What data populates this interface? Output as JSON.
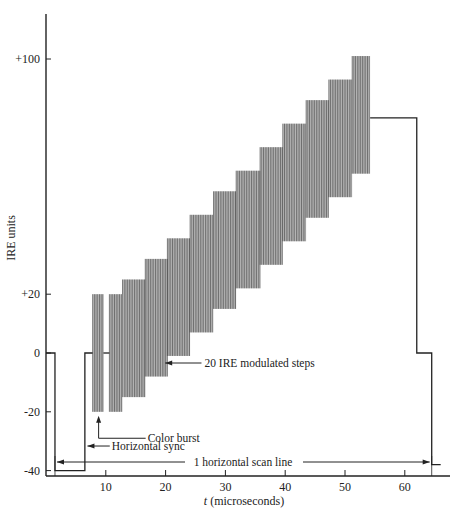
{
  "chart_data": {
    "type": "line",
    "title": "",
    "xlabel": "t (microseconds)",
    "ylabel": "IRE units",
    "xlim": [
      0,
      66
    ],
    "ylim": [
      -48,
      115
    ],
    "x_ticks": [
      10,
      20,
      30,
      40,
      50,
      60
    ],
    "y_ticks": [
      {
        "value": 100,
        "label": "+100"
      },
      {
        "value": 20,
        "label": "+20"
      },
      {
        "value": 0,
        "label": "0"
      },
      {
        "value": -20,
        "label": "-20"
      },
      {
        "value": -40,
        "label": "-40"
      }
    ],
    "grid": false,
    "legend": null,
    "baseline_waveform": {
      "name": "Line waveform (envelope)",
      "points": [
        [
          0,
          0
        ],
        [
          1.5,
          0
        ],
        [
          1.5,
          -40
        ],
        [
          6.5,
          -40
        ],
        [
          6.5,
          0
        ],
        [
          7.8,
          0
        ],
        [
          9.5,
          0
        ],
        [
          10.5,
          0
        ],
        [
          11,
          0
        ],
        [
          54,
          80
        ],
        [
          62,
          80
        ],
        [
          62,
          0
        ],
        [
          64.5,
          0
        ],
        [
          64.5,
          -38
        ],
        [
          66,
          -38
        ]
      ]
    },
    "color_burst": [
      {
        "x_start": 7.8,
        "x_end": 9.6,
        "low": -20,
        "high": 20
      },
      {
        "x_start": 10.6,
        "x_end": 12.8,
        "low": -20,
        "high": 20
      }
    ],
    "modulated_steps": {
      "name": "20 IRE modulated steps",
      "amplitude": 20,
      "steps": [
        {
          "x_start": 12.8,
          "x_end": 16.6,
          "center": 5
        },
        {
          "x_start": 16.6,
          "x_end": 20.3,
          "center": 12
        },
        {
          "x_start": 20.3,
          "x_end": 24.1,
          "center": 19
        },
        {
          "x_start": 24.1,
          "x_end": 28.0,
          "center": 27
        },
        {
          "x_start": 28.0,
          "x_end": 31.8,
          "center": 35
        },
        {
          "x_start": 31.8,
          "x_end": 35.8,
          "center": 42
        },
        {
          "x_start": 35.8,
          "x_end": 39.6,
          "center": 50
        },
        {
          "x_start": 39.6,
          "x_end": 43.5,
          "center": 58
        },
        {
          "x_start": 43.5,
          "x_end": 47.3,
          "center": 66
        },
        {
          "x_start": 47.3,
          "x_end": 51.2,
          "center": 73
        },
        {
          "x_start": 51.2,
          "x_end": 54.2,
          "center": 81
        }
      ]
    },
    "annotations": [
      {
        "text": "20 IRE modulated steps",
        "arrow_to": [
          19.6,
          0
        ],
        "text_pos": [
          26.5,
          0
        ]
      },
      {
        "text": "Color burst",
        "arrow_to": [
          8.8,
          -20
        ],
        "text_pos": [
          17,
          -29
        ]
      },
      {
        "text": "Horizontal sync",
        "arrow_to": [
          6.6,
          -33
        ],
        "text_pos": [
          11,
          -33
        ]
      },
      {
        "text": "1 horizontal scan line",
        "span": [
          1.5,
          64.5
        ],
        "y": -42
      }
    ]
  },
  "labels": {
    "ylabel": "IRE units",
    "xlabel_italic": "t",
    "xlabel_rest": " (microseconds)",
    "ann_steps": "20 IRE modulated steps",
    "ann_burst": "Color burst",
    "ann_sync": "Horizontal sync",
    "ann_scan": "1 horizontal scan line"
  }
}
